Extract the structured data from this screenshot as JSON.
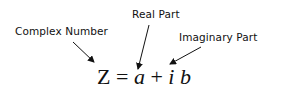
{
  "labels": {
    "complex_number": "Complex Number",
    "real_part": "Real Part",
    "imaginary_part": "Imaginary Part"
  },
  "formula": {
    "lhs": "Z",
    "equals": " = ",
    "real": "a",
    "plus": " + ",
    "imag_unit": "i",
    "space": " ",
    "imag": "b"
  },
  "colors": {
    "text": "#111111",
    "arrow": "#111111",
    "background": "#ffffff"
  }
}
